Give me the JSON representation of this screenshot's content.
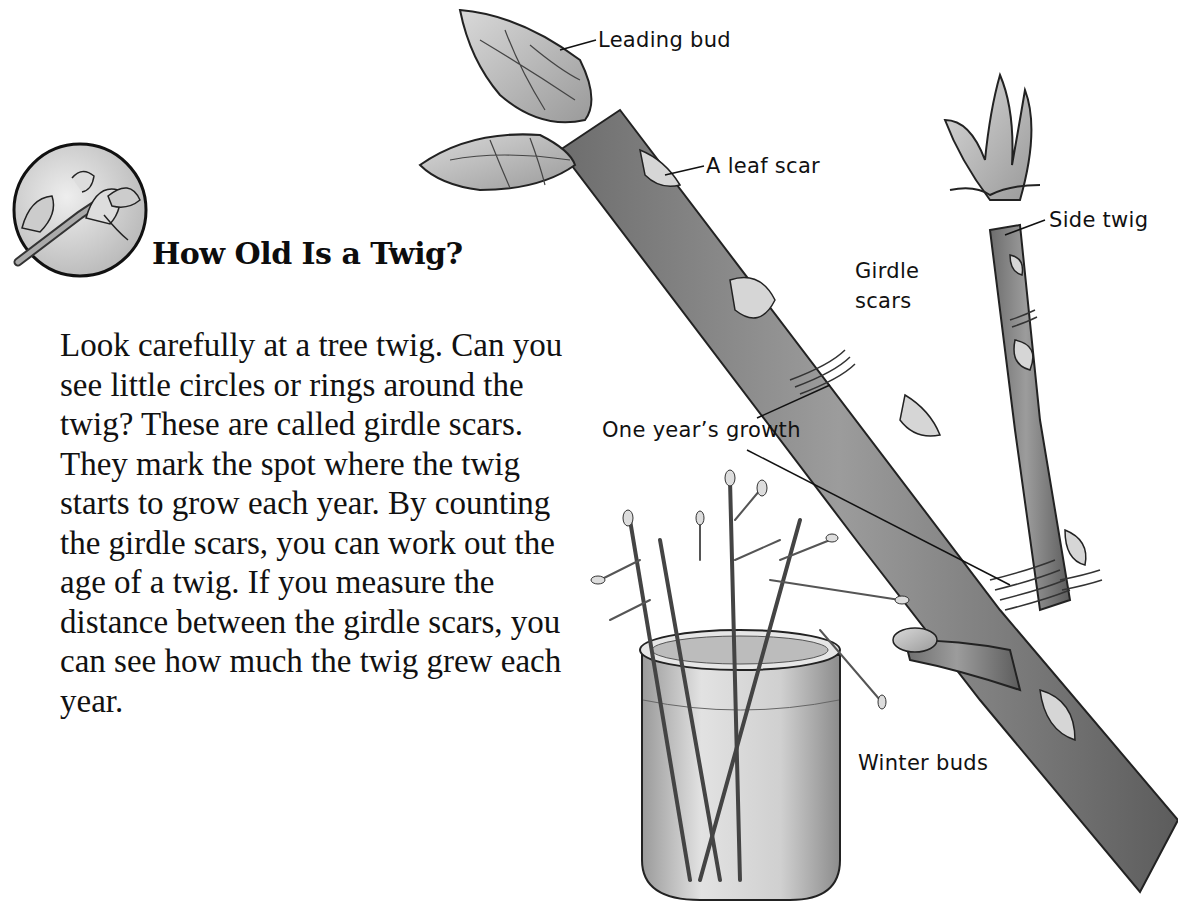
{
  "title": "How Old Is a Twig?",
  "body": "Look carefully at a tree twig. Can you see little circles or rings around the twig? These are called girdle scars. They mark the spot where the twig starts to grow each year. By counting the girdle scars, you can work out the age of a twig. If you measure the distance between the girdle scars, you can see how much the twig grew each year.",
  "labels": {
    "leading_bud": "Leading bud",
    "leaf_scar": "A leaf scar",
    "side_twig": "Side twig",
    "girdle_scars": "Girdle scars",
    "one_years_growth": "One year’s growth",
    "winter_buds": "Winter buds"
  },
  "icons": {
    "section_badge": "twig-bud-circle-icon"
  },
  "colors": {
    "ink": "#111111",
    "bark": "#8a8a8a",
    "bark_dark": "#5a5a5a",
    "bud": "#c8c8c8",
    "background": "#ffffff"
  }
}
